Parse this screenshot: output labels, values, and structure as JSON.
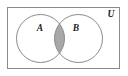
{
  "figure": {
    "type": "venn-diagram",
    "title": "",
    "background_color": "#ffffff",
    "canvas": {
      "width": 128,
      "height": 76
    }
  },
  "universe": {
    "label": "U",
    "label_x": 111,
    "label_y": 15,
    "rect": {
      "x": 7.5,
      "y": 7.5,
      "width": 112,
      "height": 61
    },
    "stroke_color": "#8a8a8a",
    "stroke_width": 1,
    "fill_color": "#ffffff"
  },
  "sets": [
    {
      "label": "A",
      "name": "set-a",
      "cx": 40.5,
      "cy": 38.5,
      "r": 24,
      "label_x": 40,
      "label_y": 28.5,
      "stroke_color": "#8a8a8a",
      "stroke_width": 1,
      "fill_color": "none"
    },
    {
      "label": "B",
      "name": "set-b",
      "cx": 78.5,
      "cy": 38.5,
      "r": 24,
      "label_x": 76,
      "label_y": 28.5,
      "stroke_color": "#8a8a8a",
      "stroke_width": 1,
      "fill_color": "none"
    }
  ],
  "intersection": {
    "name": "a-intersect-b",
    "shaded": true,
    "fill_color": "#a8a8a8",
    "stroke_color": "#8a8a8a",
    "stroke_width": 1,
    "left_extent_x": 54.5,
    "right_extent_x": 64.5,
    "top_y": 16.8,
    "bottom_y": 60.2
  }
}
